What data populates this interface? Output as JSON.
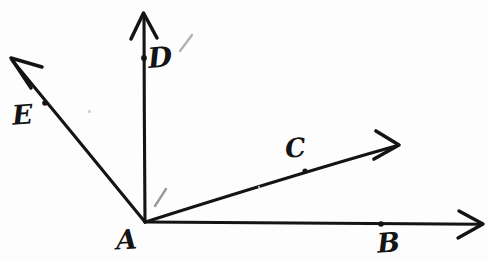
{
  "figure": {
    "type": "hand-drawn geometry diagram",
    "background_color": "#fdfdfd",
    "ink_color": "#141414",
    "pencil_mark_color": "#9a9a9a",
    "width": 487,
    "height": 261
  },
  "labels": {
    "A": "A",
    "B": "B",
    "C": "C",
    "D": "D",
    "E": "E"
  },
  "geometry": {
    "vertex": {
      "name": "A",
      "x": 145,
      "y": 222
    },
    "rays": [
      {
        "name": "ray-AB",
        "from": [
          145,
          222
        ],
        "to": [
          482,
          224
        ],
        "arrow": true,
        "point_on_ray": {
          "label": "B",
          "x": 381,
          "y": 224
        }
      },
      {
        "name": "ray-AC",
        "from": [
          145,
          222
        ],
        "to": [
          398,
          145
        ],
        "arrow": true,
        "point_on_ray": {
          "label": "C",
          "x": 305,
          "y": 171
        }
      },
      {
        "name": "ray-AD",
        "from": [
          145,
          222
        ],
        "to": [
          144,
          14
        ],
        "arrow": true,
        "point_on_ray": {
          "label": "D",
          "x": 144,
          "y": 58
        }
      },
      {
        "name": "ray-AE",
        "from": [
          145,
          222
        ],
        "to": [
          11,
          59
        ],
        "arrow": true,
        "point_on_ray": {
          "label": "E",
          "x": 45,
          "y": 103
        }
      }
    ],
    "pencil_marks": [
      {
        "name": "tick-near-vertex",
        "x1": 166,
        "y1": 189,
        "x2": 155,
        "y2": 206
      },
      {
        "name": "tick-near-D-label",
        "x1": 192,
        "y1": 35,
        "x2": 180,
        "y2": 51
      }
    ],
    "specks": [
      {
        "x": 88,
        "y": 110,
        "size": 2.5
      },
      {
        "x": 258,
        "y": 186,
        "size": 2
      }
    ]
  }
}
